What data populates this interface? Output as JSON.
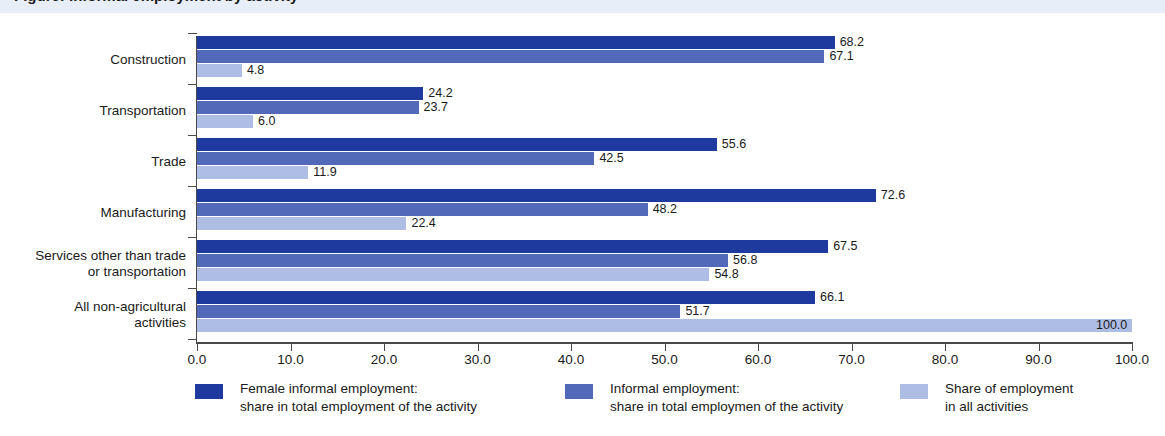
{
  "title_strip": {
    "text": "Figure: Informal employment by activity"
  },
  "chart_data": {
    "type": "bar",
    "orientation": "horizontal",
    "title": "",
    "xlabel": "",
    "ylabel": "",
    "xlim": [
      0.0,
      100.0
    ],
    "xticks": [
      "0.0",
      "10.0",
      "20.0",
      "30.0",
      "40.0",
      "50.0",
      "60.0",
      "70.0",
      "80.0",
      "90.0",
      "100.0"
    ],
    "xtick_values": [
      0,
      10,
      20,
      30,
      40,
      50,
      60,
      70,
      80,
      90,
      100
    ],
    "grid": false,
    "legend_position": "bottom",
    "categories": [
      "Construction",
      "Transportation",
      "Trade",
      "Manufacturing",
      "Services other than trade or transportation",
      "All non-agricultural activities"
    ],
    "category_lines": [
      [
        "Construction"
      ],
      [
        "Transportation"
      ],
      [
        "Trade"
      ],
      [
        "Manufacturing"
      ],
      [
        "Services other than trade",
        "or transportation"
      ],
      [
        "All non-agricultural",
        "activities"
      ]
    ],
    "series": [
      {
        "name": "Female informal employment: share in total employment of the activity",
        "color": "#1f3a9e",
        "values": [
          68.2,
          24.2,
          55.6,
          72.6,
          67.5,
          66.1
        ],
        "labels": [
          "68.2",
          "24.2",
          "55.6",
          "72.6",
          "67.5",
          "66.1"
        ]
      },
      {
        "name": "Informal employment: share in total employmen of the activity",
        "color": "#5169b8",
        "values": [
          67.1,
          23.7,
          42.5,
          48.2,
          56.8,
          51.7
        ],
        "labels": [
          "67.1",
          "23.7",
          "42.5",
          "48.2",
          "56.8",
          "51.7"
        ]
      },
      {
        "name": "Share of employment in all activities",
        "color": "#aebde4",
        "values": [
          4.8,
          6.0,
          11.9,
          22.4,
          54.8,
          100.0
        ],
        "labels": [
          "4.8",
          "6.0",
          "11.9",
          "22.4",
          "54.8",
          "100.0"
        ]
      }
    ]
  },
  "legend": [
    {
      "color_key": "s0",
      "line1": "Female informal employment:",
      "line2": "share in total employment of the activity",
      "left": 195
    },
    {
      "color_key": "s1",
      "line1": "Informal employment:",
      "line2": "share in total employmen of the activity",
      "left": 565
    },
    {
      "color_key": "s2",
      "line1": "Share of employment",
      "line2": "in all activities",
      "left": 900
    }
  ],
  "colors": {
    "series_dark": "#1f3a9e",
    "series_mid": "#5169b8",
    "series_light": "#aebde4",
    "axis": "#4a4a4a",
    "text": "#1a1a1a",
    "title_strip_bg": "#e8eef7"
  }
}
